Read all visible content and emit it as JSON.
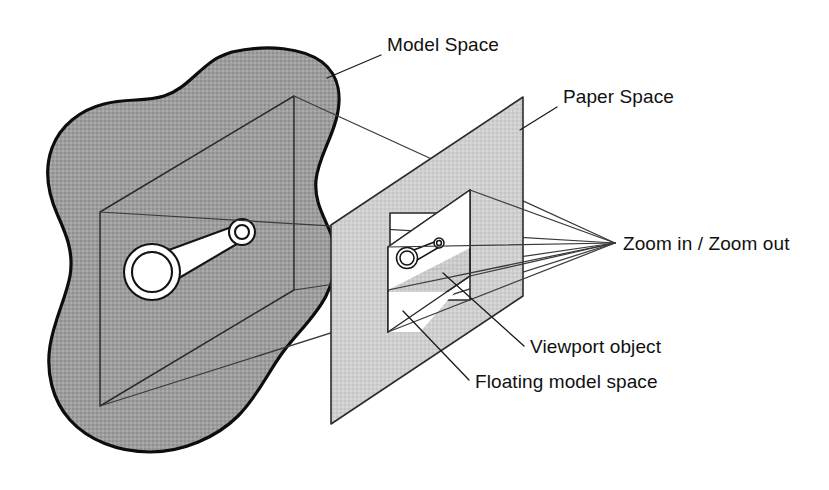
{
  "diagram": {
    "background_color": "#ffffff",
    "line_color": "#1a1a1a",
    "labels": {
      "model_space": "Model Space",
      "paper_space": "Paper Space",
      "zoom": "Zoom in / Zoom out",
      "viewport_object": "Viewport object",
      "floating_model_space": "Floating model space"
    },
    "regions": {
      "model_space": {
        "name": "Model Space",
        "fill_color": "#a0a0a0",
        "description": "Irregular blob-shaped region containing the full model drawing"
      },
      "paper_space": {
        "name": "Paper Space",
        "fill_color": "#cccccc",
        "description": "Flat sheet parallelogram with a rectangular viewport cut out"
      },
      "viewport": {
        "name": "Viewport object",
        "fill_color": "#ffffff",
        "description": "White window in the paper sheet showing the scaled model"
      },
      "floating_model_space": {
        "name": "Floating model space",
        "fill_color": "#c8c8c8",
        "description": "Tilted plane projecting from the viewport toward the model"
      }
    },
    "part": {
      "name": "connecting-rod",
      "fill_color": "#ffffff",
      "stroke_color": "#141414",
      "description": "Connecting rod with a large bore at one end and a small bore at the other"
    },
    "projection": {
      "name": "Zoom in / Zoom out",
      "apex_label": "Zoom in / Zoom out",
      "description": "Sight lines converging to a single viewing point at the right"
    }
  }
}
